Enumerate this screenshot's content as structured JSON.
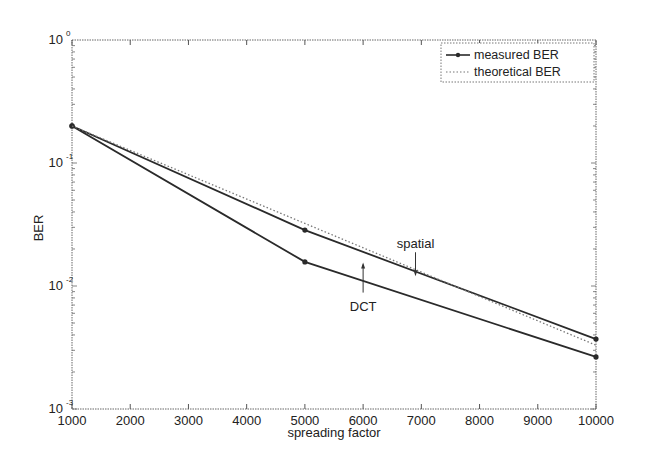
{
  "chart_data": {
    "type": "line",
    "title": "",
    "xlabel": "spreading factor",
    "ylabel": "BER",
    "xscale": "linear",
    "yscale": "log",
    "xlim": [
      1000,
      10000
    ],
    "ylim": [
      0.001,
      1
    ],
    "grid": false,
    "legend_position": "upper right",
    "x_ticks": [
      1000,
      2000,
      3000,
      4000,
      5000,
      6000,
      7000,
      8000,
      9000,
      10000
    ],
    "x_tick_labels": [
      "1000",
      "2000",
      "3000",
      "4000",
      "5000",
      "6000",
      "7000",
      "8000",
      "9000",
      "10000"
    ],
    "y_ticks": [
      1,
      0.1,
      0.01,
      0.001
    ],
    "y_tick_labels": [
      {
        "base": "10",
        "exp": "0"
      },
      {
        "base": "10",
        "exp": "-1"
      },
      {
        "base": "10",
        "exp": "-2"
      },
      {
        "base": "10",
        "exp": "-3"
      }
    ],
    "legend": [
      "measured BER",
      "theoretical BER"
    ],
    "series": [
      {
        "name": "measured BER (spatial)",
        "style": "solid-marker",
        "x": [
          1000,
          5000,
          10000
        ],
        "values": [
          0.2,
          0.0285,
          0.0037
        ]
      },
      {
        "name": "measured BER (DCT)",
        "style": "solid-marker",
        "x": [
          1000,
          5000,
          10000
        ],
        "values": [
          0.2,
          0.0157,
          0.00265
        ]
      },
      {
        "name": "theoretical BER",
        "style": "dotted",
        "x": [
          1000,
          10000
        ],
        "values": [
          0.2,
          0.0033
        ]
      }
    ],
    "annotations": [
      {
        "text": "spatial",
        "arrow_to": {
          "x": 6900,
          "y": 0.012
        }
      },
      {
        "text": "DCT",
        "arrow_to": {
          "x": 6000,
          "y": 0.0155
        }
      }
    ]
  },
  "colors": {
    "line": "#2a2a2a",
    "axis": "#555555",
    "text": "#222222"
  }
}
